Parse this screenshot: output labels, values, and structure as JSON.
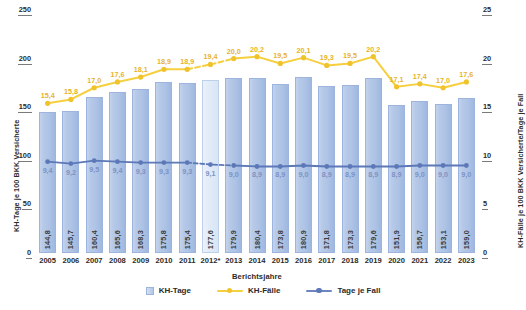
{
  "chart_data": {
    "type": "bar",
    "title": "",
    "subtitle": "",
    "xlabel": "Berichtsjahre",
    "ylabel": "KH-Tage je 100 BKK Versicherte",
    "y2label": "KH-Fälle je 100 BKK Versicherte/Tage je Fall",
    "ylim": [
      0,
      250
    ],
    "y2lim": [
      0,
      25
    ],
    "yticks": [
      "0",
      "50",
      "100",
      "150",
      "200",
      "250"
    ],
    "y2ticks": [
      "0",
      "5",
      "10",
      "15",
      "20",
      "25"
    ],
    "grid": false,
    "legend_position": "bottom",
    "categories": [
      "2005",
      "2006",
      "2007",
      "2008",
      "2009",
      "2010",
      "2011",
      "2012*",
      "2013",
      "2014",
      "2015",
      "2016",
      "2017",
      "2018",
      "2019",
      "2020",
      "2021",
      "2022",
      "2023"
    ],
    "series": [
      {
        "name": "KH-Tage",
        "type": "bar",
        "axis": "left",
        "color": "#b3c6e6",
        "values": [
          144.8,
          145.7,
          160.4,
          165.6,
          168.3,
          175.8,
          175.4,
          177.6,
          179.9,
          180.4,
          173.8,
          180.9,
          171.8,
          173.3,
          179.6,
          151.9,
          156.7,
          153.1,
          159.0
        ],
        "labels": [
          "144,8",
          "145,7",
          "160,4",
          "165,6",
          "168,3",
          "175,8",
          "175,4",
          "177,6",
          "179,9",
          "180,4",
          "173,8",
          "180,9",
          "171,8",
          "173,3",
          "179,6",
          "151,9",
          "156,7",
          "153,1",
          "159,0"
        ],
        "highlight_index": 7
      },
      {
        "name": "KH-Fälle",
        "type": "line",
        "axis": "right",
        "color": "#f5cf3e",
        "values": [
          15.4,
          15.8,
          17.0,
          17.6,
          18.1,
          18.9,
          18.9,
          19.4,
          20.0,
          20.2,
          19.5,
          20.1,
          19.3,
          19.5,
          20.2,
          17.1,
          17.4,
          17.0,
          17.6
        ],
        "labels": [
          "15,4",
          "15,8",
          "17,0",
          "17,6",
          "18,1",
          "18,9",
          "18,9",
          "19,4",
          "20,0",
          "20,2",
          "19,5",
          "20,1",
          "19,3",
          "19,5",
          "20,2",
          "17,1",
          "17,4",
          "17,0",
          "17,6"
        ],
        "dashed_segments": [
          6,
          7
        ]
      },
      {
        "name": "Tage je Fall",
        "type": "line",
        "axis": "right",
        "color": "#5c78b8",
        "values": [
          9.4,
          9.2,
          9.5,
          9.4,
          9.3,
          9.3,
          9.3,
          9.1,
          9.0,
          8.9,
          8.9,
          9.0,
          8.9,
          8.9,
          8.9,
          8.9,
          9.0,
          9.0,
          9.0
        ],
        "labels": [
          "9,4",
          "9,2",
          "9,5",
          "9,4",
          "9,3",
          "9,3",
          "9,3",
          "9,1",
          "9,0",
          "8,9",
          "8,9",
          "9,0",
          "8,9",
          "8,9",
          "8,9",
          "8,9",
          "9,0",
          "9,0",
          "9,0"
        ],
        "dashed_segments": [
          6,
          7
        ]
      }
    ]
  },
  "legend": {
    "items": [
      {
        "label": "KH-Tage",
        "marker": "box",
        "color": "#b3c6e6"
      },
      {
        "label": "KH-Fälle",
        "marker": "line",
        "color": "#f5cf3e"
      },
      {
        "label": "Tage je Fall",
        "marker": "line",
        "color": "#5c78b8"
      }
    ]
  }
}
